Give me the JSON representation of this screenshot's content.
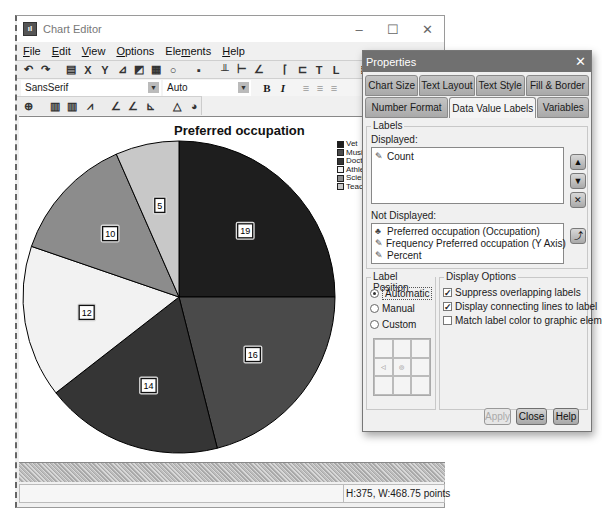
{
  "window": {
    "title": "Chart Editor",
    "icon": "spss-chart-icon",
    "controls": {
      "minimize": "–",
      "maximize": "☐",
      "close": "✕"
    }
  },
  "menubar": [
    {
      "label": "File",
      "u": "F",
      "rest": "ile"
    },
    {
      "label": "Edit",
      "u": "E",
      "rest": "dit"
    },
    {
      "label": "View",
      "u": "V",
      "rest": "iew"
    },
    {
      "label": "Options",
      "u": "O",
      "rest": "ptions"
    },
    {
      "label": "Elements",
      "pre": "Ele",
      "u": "m",
      "rest": "ents"
    },
    {
      "label": "Help",
      "u": "H",
      "rest": "elp"
    }
  ],
  "toolbar": {
    "icons": [
      "undo-icon",
      "redo-icon",
      "properties-icon",
      "x-axis-icon",
      "y-axis-icon",
      "scale-icon",
      "scale-alt-icon",
      "fill-icon",
      "lasso-icon",
      "select-icon",
      "ref-line-y-icon",
      "ref-line-x-icon",
      "fit-line-icon",
      "title-icon",
      "subtitle-icon",
      "textbox-icon",
      "footnote-icon",
      "grid-icon",
      "table-icon"
    ]
  },
  "fontbar": {
    "font_family": "SansSerif",
    "font_size": "Auto",
    "bold": "B",
    "italic": "I"
  },
  "chart": {
    "title": "Preferred occupation",
    "status": "H:375, W:468.75 points"
  },
  "chart_data": {
    "type": "pie",
    "title": "Preferred occupation",
    "categories": [
      "Vet",
      "Musician",
      "Doctor",
      "Athlete",
      "Scientist",
      "Teacher"
    ],
    "legend_visible_text": [
      "Vet",
      "Musi",
      "Docto",
      "Athle",
      "Scien",
      "Teac"
    ],
    "values": [
      19,
      16,
      14,
      12,
      10,
      5
    ],
    "colors": [
      "#1e1e1e",
      "#4a4a4a",
      "#353535",
      "#f2f2f2",
      "#8c8c8c",
      "#c8c8c8"
    ],
    "data_labels": [
      "19",
      "16",
      "14",
      "12",
      "10",
      "5"
    ],
    "start_angle_deg": 0,
    "direction": "clockwise",
    "legend_position": "right"
  },
  "properties": {
    "title": "Properties",
    "tabs_row1": [
      "Chart Size",
      "Text Layout",
      "Text Style",
      "Fill & Border"
    ],
    "tabs_row2": [
      "Number Format",
      "Data Value Labels",
      "Variables"
    ],
    "active_tab": "Data Value Labels",
    "labels_group": "Labels",
    "displayed_label": "Displayed:",
    "displayed_items": [
      "Count"
    ],
    "not_displayed_label": "Not Displayed:",
    "not_displayed_items": [
      {
        "icon": "categorical-variable-icon",
        "text": "Preferred occupation (Occupation)"
      },
      {
        "icon": "scale-variable-icon",
        "text": "Frequency Preferred occupation (Y Axis)"
      },
      {
        "icon": "scale-variable-icon",
        "text": "Percent"
      }
    ],
    "label_position": {
      "group": "Label Position",
      "options": [
        "Automatic",
        "Manual",
        "Custom"
      ],
      "selected": "Automatic"
    },
    "display_options": {
      "group": "Display Options",
      "items": [
        {
          "label": "Suppress overlapping labels",
          "checked": true
        },
        {
          "label": "Display connecting lines to label",
          "checked": true
        },
        {
          "label": "Match label color to graphic element",
          "checked": false
        }
      ]
    },
    "buttons": {
      "apply": "Apply",
      "close": "Close",
      "help": "Help"
    }
  }
}
